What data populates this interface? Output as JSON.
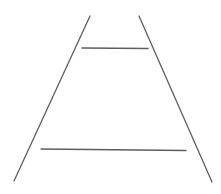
{
  "diagram": {
    "title": "",
    "background": "#ffffff",
    "stroke_color": "#5e5e5e",
    "stroke_width": 1.3,
    "converging_lines": [
      {
        "name": "left-converging-line",
        "x1": 90,
        "y1": 16,
        "x2": 14,
        "y2": 181
      },
      {
        "name": "right-converging-line",
        "x1": 139,
        "y1": 16,
        "x2": 212,
        "y2": 182
      }
    ],
    "horizontal_lines": [
      {
        "name": "upper-horizontal-line",
        "x1": 82,
        "y1": 48,
        "x2": 148,
        "y2": 48.5
      },
      {
        "name": "lower-horizontal-line",
        "x1": 41,
        "y1": 149,
        "x2": 186,
        "y2": 150.5
      }
    ]
  }
}
